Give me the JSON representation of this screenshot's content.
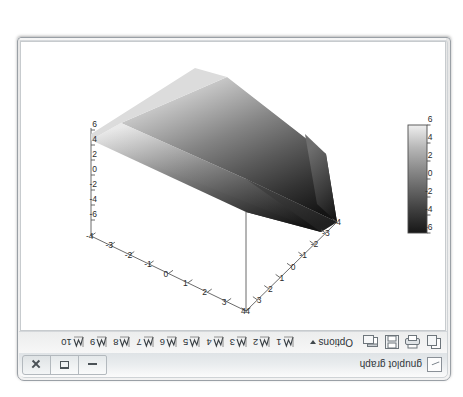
{
  "window": {
    "title": "gnuplot graph",
    "title_icon": "graph-window-icon",
    "controls": {
      "minimize_label": "Minimize",
      "maximize_label": "Maximize",
      "close_label": "Close"
    }
  },
  "toolbar": {
    "icons": [
      {
        "name": "copy-to-clipboard-icon",
        "label": "Copy"
      },
      {
        "name": "print-icon",
        "label": "Print"
      },
      {
        "name": "save-icon",
        "label": "Save"
      },
      {
        "name": "open-window-icon",
        "label": "Grid"
      }
    ],
    "options_label": "Options",
    "options_caret": "chevron-down-icon",
    "plot_buttons": [
      {
        "label": "1",
        "icon": "curve-toggle-icon"
      },
      {
        "label": "2",
        "icon": "curve-toggle-icon"
      },
      {
        "label": "3",
        "icon": "curve-toggle-icon"
      },
      {
        "label": "4",
        "icon": "curve-toggle-icon"
      },
      {
        "label": "5",
        "icon": "curve-toggle-icon"
      },
      {
        "label": "6",
        "icon": "curve-toggle-icon"
      },
      {
        "label": "7",
        "icon": "curve-toggle-icon"
      },
      {
        "label": "8",
        "icon": "curve-toggle-icon"
      },
      {
        "label": "9",
        "icon": "curve-toggle-icon"
      },
      {
        "label": "10",
        "icon": "curve-toggle-icon"
      }
    ]
  },
  "statusbar": {
    "text": "view: 40.0000, 39.0000   scale: 1.00000, 1.00000",
    "view_rot_x": "40.0000",
    "view_rot_z": "39.0000",
    "scale_x": "1.00000",
    "scale_z": "1.00000"
  },
  "chart_data": {
    "type": "surface3d",
    "title": "",
    "xlabel": "",
    "ylabel": "",
    "zlabel": "",
    "palette": "grayscale",
    "surface_function": "z = x + y (tilted plane surface)",
    "x_ticks": [
      -4,
      -3,
      -2,
      -1,
      0,
      1,
      2,
      3,
      4
    ],
    "y_ticks": [
      -4,
      -3,
      -2,
      -1,
      0,
      1,
      2,
      3,
      4
    ],
    "z_ticks": [
      -6,
      -4,
      -2,
      0,
      2,
      4,
      6
    ],
    "xlim": [
      -4,
      4
    ],
    "ylim": [
      -4,
      4
    ],
    "zlim": [
      -6,
      6
    ],
    "colorbar": {
      "ticks": [
        -6,
        -4,
        -2,
        0,
        2,
        4,
        6
      ],
      "min": -6,
      "max": 6,
      "low_color": "#ffffff",
      "high_color": "#1a1a1a",
      "position": "left"
    },
    "grid": false,
    "legend": "none",
    "view": {
      "rot_x": 40.0,
      "rot_z": 39.0,
      "scale": 1.0,
      "scale_z": 1.0
    }
  },
  "colors": {
    "axis": "#555555",
    "surface_dark": "#1f1f1f",
    "surface_light": "#f0f0f0",
    "window_chrome": "#e9ecee",
    "canvas_bg": "#ffffff"
  }
}
